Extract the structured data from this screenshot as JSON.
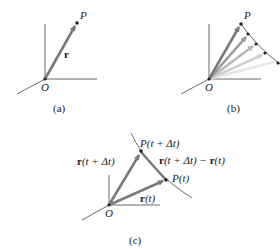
{
  "panels": {
    "a": {
      "caption": "(a)",
      "origin_label": "O",
      "point_label": "P",
      "vector_label": "r"
    },
    "b": {
      "caption": "(b)",
      "origin_label": "O",
      "point_label": "P"
    },
    "c": {
      "caption": "(c)",
      "origin_label": "O",
      "point_dt_label": "P(t + Δt)",
      "point_t_label": "P(t)",
      "vector_dt_label": "r(t + Δt)",
      "vector_t_label": "r(t)",
      "difference_label": "r(t + Δt) − r(t)"
    }
  },
  "colors": {
    "axis": "#444444",
    "vector": "#7a7a7a",
    "point": "#222222"
  }
}
